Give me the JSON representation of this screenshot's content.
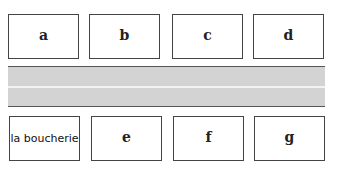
{
  "top_row": [
    {
      "label": "a"
    },
    {
      "label": "b"
    },
    {
      "label": "c"
    },
    {
      "label": "d"
    }
  ],
  "bottom_row": [
    {
      "label": "la boucherie"
    },
    {
      "label": "e"
    },
    {
      "label": "f"
    },
    {
      "label": "g"
    }
  ],
  "colors": {
    "road": "#d3d3d3",
    "border": "#444444"
  }
}
